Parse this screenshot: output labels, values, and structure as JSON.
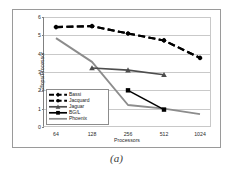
{
  "caption": "(a)",
  "chart_data": {
    "type": "line",
    "title": "",
    "xlabel": "Processors",
    "ylabel": "Gflops/Processor",
    "categories": [
      "64",
      "128",
      "256",
      "512",
      "1024"
    ],
    "x": [
      64,
      128,
      256,
      512,
      1024
    ],
    "xlim": [
      64,
      1024
    ],
    "xscale": "log2",
    "ylim": [
      0,
      6
    ],
    "yticks": [
      "0",
      "1",
      "2",
      "3",
      "4",
      "5",
      "6"
    ],
    "grid": true,
    "legend_position": "bottom-left",
    "series": [
      {
        "name": "Bassi",
        "color": "#000000",
        "style": "dashed",
        "marker": "diamond",
        "x": [
          64,
          128,
          256,
          512,
          1024
        ],
        "values": [
          5.45,
          5.5,
          5.1,
          4.72,
          3.77
        ]
      },
      {
        "name": "Jacquard",
        "color": "#000000",
        "style": "dashed",
        "marker": "circle",
        "x": [
          64,
          128,
          256,
          512,
          1024
        ],
        "values": [
          5.45,
          5.5,
          5.1,
          4.72,
          3.77
        ]
      },
      {
        "name": "Jaguar",
        "color": "#4d4d4d",
        "style": "solid",
        "marker": "triangle",
        "x": [
          128,
          256,
          512
        ],
        "values": [
          3.22,
          3.1,
          2.85
        ]
      },
      {
        "name": "BG/L",
        "color": "#000000",
        "style": "solid",
        "marker": "square",
        "x": [
          256,
          512
        ],
        "values": [
          2.0,
          0.95
        ]
      },
      {
        "name": "Phoenix",
        "color": "#8c8c8c",
        "style": "solid",
        "marker": "none",
        "x": [
          64,
          128,
          256,
          512,
          1024
        ],
        "values": [
          4.85,
          3.55,
          1.2,
          1.0,
          0.7
        ]
      }
    ]
  }
}
